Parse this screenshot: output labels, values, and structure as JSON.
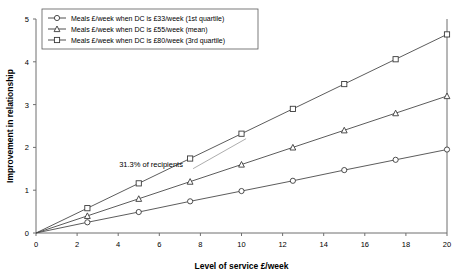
{
  "chart_data": {
    "type": "line",
    "title": "",
    "xlabel": "Level of service £/week",
    "ylabel": "Improvement in relationship",
    "xlim": [
      0,
      20
    ],
    "ylim": [
      0,
      5
    ],
    "xticks": [
      0,
      2,
      4,
      6,
      8,
      10,
      12,
      14,
      16,
      18,
      20
    ],
    "xtick_labels": [
      "0",
      "2",
      "4",
      "6",
      "8",
      "10",
      "12",
      "14",
      "16",
      "18",
      "20"
    ],
    "yticks": [
      0,
      1,
      2,
      3,
      4,
      5
    ],
    "ytick_labels": [
      "0",
      "1",
      "2",
      "3",
      "4",
      "5"
    ],
    "grid": false,
    "legend_position": "top-left",
    "x": [
      0,
      2.5,
      5,
      7.5,
      10,
      12.5,
      15,
      17.5,
      20
    ],
    "series": [
      {
        "name": "Meals £/week when DC is £33/week (1st quartile)",
        "marker": "circle",
        "values": [
          0,
          0.25,
          0.49,
          0.74,
          0.98,
          1.22,
          1.47,
          1.71,
          1.95
        ]
      },
      {
        "name": "Meals £/week when DC is £55/week (mean)",
        "marker": "triangle",
        "values": [
          0,
          0.4,
          0.8,
          1.2,
          1.6,
          2.0,
          2.4,
          2.8,
          3.2
        ]
      },
      {
        "name": "Meals £/week when DC is £80/week (3rd quartile)",
        "marker": "square",
        "values": [
          0,
          0.58,
          1.16,
          1.74,
          2.32,
          2.9,
          3.48,
          4.06,
          4.64
        ]
      }
    ],
    "annotations": [
      {
        "text": "31.3% of recipients",
        "x": 5.6,
        "y": 1.55
      }
    ],
    "colors": {
      "line": "#3a3a3a",
      "axis": "#6f6f6f",
      "marker_fill": "#ffffff",
      "background": "#ffffff"
    }
  }
}
